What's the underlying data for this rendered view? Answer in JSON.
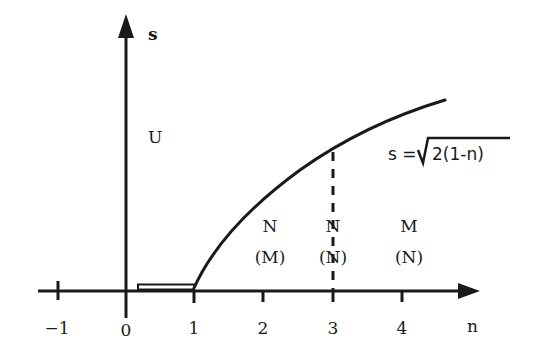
{
  "diagram": {
    "axes": {
      "x_label": "n",
      "y_label": "s"
    },
    "x_ticks": [
      {
        "value": -1,
        "label": "−1"
      },
      {
        "value": 0,
        "label": "0"
      },
      {
        "value": 1,
        "label": "1"
      },
      {
        "value": 2,
        "label": "2"
      },
      {
        "value": 3,
        "label": "3"
      },
      {
        "value": 4,
        "label": "4"
      }
    ],
    "region_labels": {
      "upper_left": "U",
      "region_a_top": "N",
      "region_a_bottom": "(M)",
      "region_b_top": "N",
      "region_b_bottom": "(N)",
      "region_c_top": "M",
      "region_c_bottom": "(N)"
    },
    "curve": {
      "formula_lhs": "s =",
      "formula_radicand": "2(1-n)",
      "description": "curve starting at n=1 on the n-axis rising to the upper right"
    },
    "marked_segment": {
      "from_n": 0,
      "to_n": 1,
      "description": "thin double-line bar just above the n-axis between n=0 and n=1"
    },
    "dashed_line": {
      "at_n": 3,
      "description": "vertical dashed line from n-axis to the curve at n=3"
    },
    "colors": {
      "ink": "#1a1a1a",
      "background": "#ffffff"
    }
  }
}
